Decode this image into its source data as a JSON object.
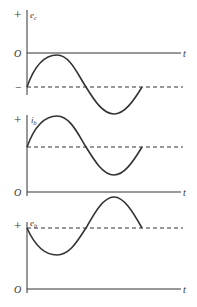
{
  "diagram": {
    "title": "",
    "colors": {
      "stroke": "#333333",
      "background": "#ffffff"
    },
    "panels": [
      {
        "id": "ec",
        "signal_label": "e",
        "signal_sub": "c",
        "plus_label": "+",
        "zero_label": "O",
        "minus_label": "−",
        "time_label": "t",
        "description": "Sinusoid centred on a negative DC level (dashed); first peak touches 0 axis"
      },
      {
        "id": "ib",
        "signal_label": "i",
        "signal_sub": "b",
        "plus_label": "+",
        "zero_label": "O",
        "time_label": "t",
        "description": "Sinusoid in phase with e_c, riding on a positive DC level (dashed)"
      },
      {
        "id": "eb",
        "signal_label": "e",
        "signal_sub": "b",
        "plus_label": "+",
        "zero_label": "O",
        "time_label": "t",
        "description": "Sinusoid 180° out of phase, riding on a positive DC level (dashed)"
      }
    ]
  }
}
